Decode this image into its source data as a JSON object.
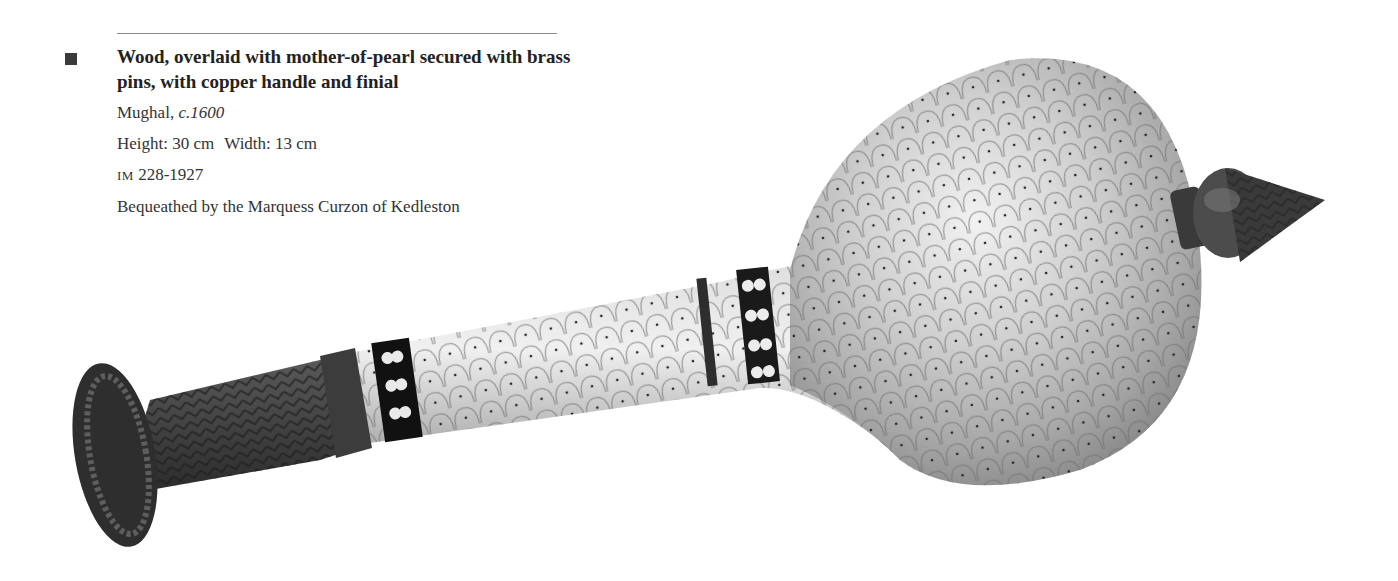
{
  "caption": {
    "title": "Wood, overlaid with mother-of-pearl secured with brass pins, with copper handle and finial",
    "origin_prefix": "Mughal, ",
    "origin_date": "c.1600",
    "height_label": "Height: 30 cm",
    "width_label": "Width: 13 cm",
    "accession_prefix": "IM",
    "accession_number": " 228-1927",
    "credit": "Bequeathed by the Marquess Curzon of Kedleston"
  },
  "figure": {
    "colors": {
      "pearl_light": "#e6e6e6",
      "pearl_mid": "#b9b9b9",
      "pearl_dark": "#8e8e8e",
      "copper_dark": "#3d3d3d",
      "copper_mid": "#5a5a5a"
    }
  }
}
